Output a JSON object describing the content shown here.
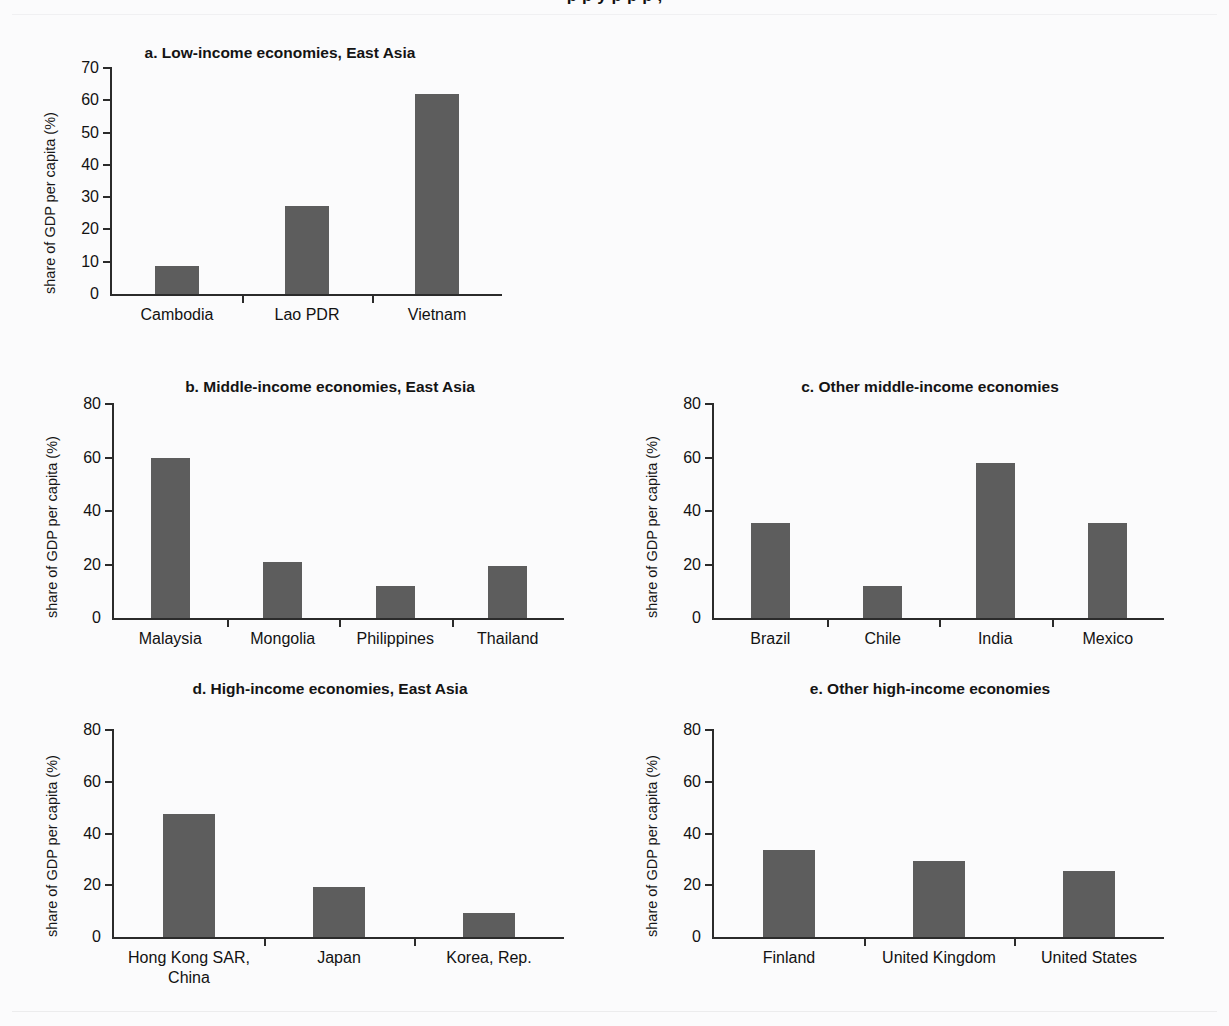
{
  "figure": {
    "cropped_header": "p  p    y  p          p  p ,",
    "y_axis_label": "share of GDP per capita (%)"
  },
  "chart_data": [
    {
      "id": "a",
      "type": "bar",
      "title": "a. Low-income economies, East Asia",
      "categories": [
        "Cambodia",
        "Lao PDR",
        "Vietnam"
      ],
      "values": [
        8.8,
        27.4,
        61.8
      ],
      "xlabel": "",
      "ylabel": "share of GDP per capita (%)",
      "ylim": [
        0,
        70
      ],
      "yticks": [
        0,
        10,
        20,
        30,
        40,
        50,
        60,
        70
      ],
      "grid": false,
      "legend": "none",
      "bar_color": "#5d5d5d"
    },
    {
      "id": "b",
      "type": "bar",
      "title": "b. Middle-income economies, East Asia",
      "categories": [
        "Malaysia",
        "Mongolia",
        "Philippines",
        "Thailand"
      ],
      "values": [
        60.0,
        20.8,
        11.8,
        19.3
      ],
      "xlabel": "",
      "ylabel": "share of GDP per capita (%)",
      "ylim": [
        0,
        80
      ],
      "yticks": [
        0,
        20,
        40,
        60,
        80
      ],
      "grid": false,
      "legend": "none",
      "bar_color": "#5d5d5d"
    },
    {
      "id": "c",
      "type": "bar",
      "title": "c. Other middle-income economies",
      "categories": [
        "Brazil",
        "Chile",
        "India",
        "Mexico"
      ],
      "values": [
        35.5,
        12.0,
        58.0,
        35.7
      ],
      "xlabel": "",
      "ylabel": "share of GDP per capita (%)",
      "ylim": [
        0,
        80
      ],
      "yticks": [
        0,
        20,
        40,
        60,
        80
      ],
      "grid": false,
      "legend": "none",
      "bar_color": "#5d5d5d"
    },
    {
      "id": "d",
      "type": "bar",
      "title": "d. High-income economies, East Asia",
      "categories": [
        "Hong Kong SAR,\nChina",
        "Japan",
        "Korea, Rep."
      ],
      "values": [
        47.5,
        19.4,
        9.2
      ],
      "xlabel": "",
      "ylabel": "share of GDP per capita (%)",
      "ylim": [
        0,
        80
      ],
      "yticks": [
        0,
        20,
        40,
        60,
        80
      ],
      "grid": false,
      "legend": "none",
      "bar_color": "#5d5d5d"
    },
    {
      "id": "e",
      "type": "bar",
      "title": "e. Other high-income economies",
      "categories": [
        "Finland",
        "United Kingdom",
        "United States"
      ],
      "values": [
        33.8,
        29.2,
        25.6
      ],
      "xlabel": "",
      "ylabel": "share of GDP per capita (%)",
      "ylim": [
        0,
        80
      ],
      "yticks": [
        0,
        20,
        40,
        60,
        80
      ],
      "grid": false,
      "legend": "none",
      "bar_color": "#5d5d5d"
    }
  ]
}
